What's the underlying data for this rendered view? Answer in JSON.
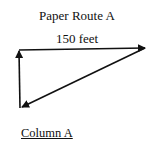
{
  "diagram": {
    "title": "Paper Route A",
    "segments": [
      {
        "label": "150 feet",
        "direction": "east"
      },
      {
        "label": "",
        "direction": "southwest"
      },
      {
        "label": "",
        "direction": "north"
      }
    ],
    "caption": "Column A",
    "stroke_color": "#111111"
  }
}
